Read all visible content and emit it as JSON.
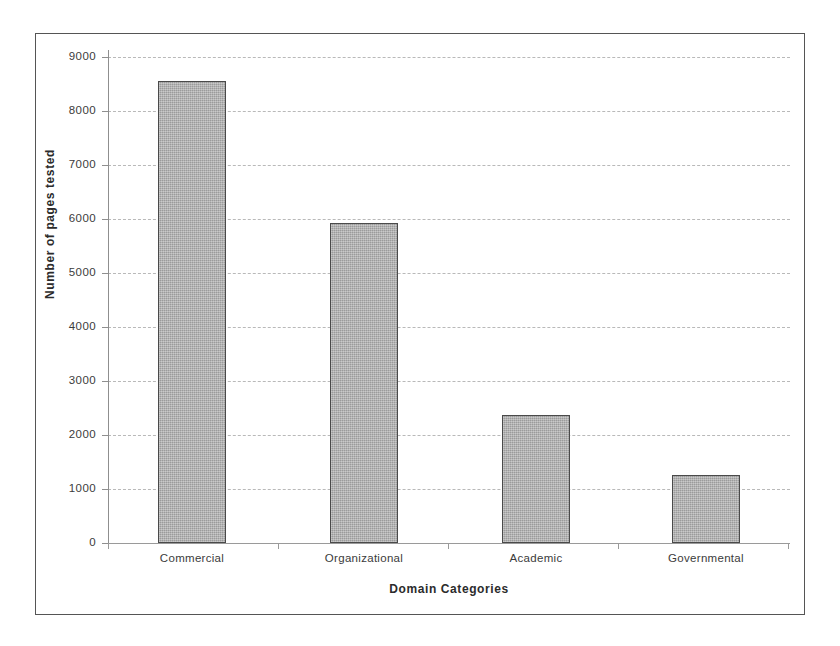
{
  "chart_data": {
    "type": "bar",
    "title": "",
    "categories": [
      "Commercial",
      "Organizational",
      "Academic",
      "Governmental"
    ],
    "values": [
      8550,
      5930,
      2370,
      1250
    ],
    "series": [
      {
        "name": "Number of pages tested",
        "values": [
          8550,
          5930,
          2370,
          1250
        ]
      }
    ],
    "xlabel": "Domain Categories",
    "ylabel": "Number of pages tested",
    "ylim": [
      0,
      9000
    ],
    "ytick_step": 1000,
    "yticks": [
      0,
      1000,
      2000,
      3000,
      4000,
      5000,
      6000,
      7000,
      8000,
      9000
    ],
    "ytick_labels": [
      "0",
      "1000",
      "2000",
      "3000",
      "4000",
      "5000",
      "6000",
      "7000",
      "8000",
      "9000"
    ],
    "grid": true,
    "grid_axis": "y",
    "grid_style": "dash-dot",
    "legend": false,
    "legend_position": "none",
    "bar_fill_color": "#ababab",
    "bar_edge_color": "#4a4a4a",
    "grid_color": "#b9b9b9",
    "axis_color": "#8f8f8f",
    "frame_color": "#555555",
    "background_color": "#ffffff",
    "text_color": "#3b3b3b"
  }
}
